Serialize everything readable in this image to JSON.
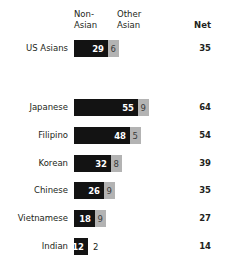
{
  "header": {
    "col_nonasian": "Non-\nAsian",
    "col_otherasian": "Other\nAsian",
    "col_net": "Net"
  },
  "chart_data": {
    "type": "bar",
    "title": "",
    "subtitle": "",
    "xlabel": "",
    "ylabel": "",
    "stacked": true,
    "orientation": "horizontal",
    "grid": false,
    "legend_position": "top",
    "xlim": [
      0,
      70
    ],
    "categories": [
      "US Asians",
      "Japanese",
      "Filipino",
      "Korean",
      "Chinese",
      "Vietnamese",
      "Indian"
    ],
    "series": [
      {
        "name": "Non-Asian",
        "values": [
          29,
          55,
          48,
          32,
          26,
          18,
          12
        ]
      },
      {
        "name": "Other Asian",
        "values": [
          6,
          9,
          5,
          8,
          9,
          9,
          2
        ]
      }
    ],
    "net": [
      35,
      64,
      54,
      39,
      35,
      27,
      14
    ],
    "rows": [
      {
        "label": "US Asians",
        "nonasian": 29,
        "otherasian": 6,
        "net": 35,
        "top": 40,
        "other_outside": false
      },
      {
        "label": "Japanese",
        "nonasian": 55,
        "otherasian": 9,
        "net": 64,
        "top": 99,
        "other_outside": false
      },
      {
        "label": "Filipino",
        "nonasian": 48,
        "otherasian": 5,
        "net": 54,
        "top": 127,
        "other_outside": false
      },
      {
        "label": "Korean",
        "nonasian": 32,
        "otherasian": 8,
        "net": 39,
        "top": 155,
        "other_outside": false
      },
      {
        "label": "Chinese",
        "nonasian": 26,
        "otherasian": 9,
        "net": 35,
        "top": 182,
        "other_outside": false
      },
      {
        "label": "Vietnamese",
        "nonasian": 18,
        "otherasian": 9,
        "net": 27,
        "top": 210,
        "other_outside": false
      },
      {
        "label": "Indian",
        "nonasian": 12,
        "otherasian": 2,
        "net": 14,
        "top": 238,
        "other_outside": true
      }
    ],
    "colors": {
      "nonasian": "#131313",
      "otherasian": "#b3b3b3",
      "text": "#231f20",
      "background": "#ffffff"
    },
    "px_per_unit": 1.16
  }
}
